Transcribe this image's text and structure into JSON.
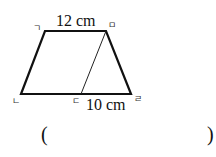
{
  "diagram": {
    "shape": "trapezoid",
    "vertices": {
      "top_left": {
        "label": "ㄱ",
        "x": 45,
        "y": 31
      },
      "top_right": {
        "label": "ㅁ",
        "x": 106,
        "y": 31
      },
      "bottom_left": {
        "label": "ㄴ",
        "x": 21,
        "y": 94
      },
      "bottom_mid": {
        "label": "ㄷ",
        "x": 81,
        "y": 94
      },
      "bottom_right": {
        "label": "ㄹ",
        "x": 131,
        "y": 94
      }
    },
    "measurements": {
      "top": "12 cm",
      "bottom_segment": "10 cm"
    },
    "segment": "ㅁㄷ"
  },
  "answer": {
    "open_paren": "(",
    "close_paren": ")",
    "value": ""
  }
}
